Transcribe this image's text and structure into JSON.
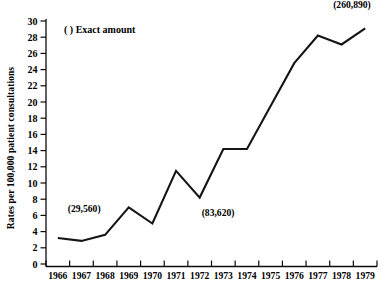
{
  "chart_data": {
    "type": "line",
    "title": "",
    "xlabel": "",
    "ylabel": "Rates per 100,000 patient consultations",
    "ylim": [
      0,
      30
    ],
    "ytick_step": 2,
    "grid": false,
    "legend_position": "top-left",
    "legend_entries": [
      "(  ) Exact amount"
    ],
    "categories": [
      "1966",
      "1967",
      "1968",
      "1969",
      "1970",
      "1971",
      "1972",
      "1973",
      "1974",
      "1975",
      "1976",
      "1977",
      "1978",
      "1979"
    ],
    "x": [
      1966,
      1967,
      1968,
      1969,
      1970,
      1971,
      1972,
      1973,
      1974,
      1975,
      1976,
      1977,
      1978,
      1979
    ],
    "values": [
      3.2,
      2.85,
      3.6,
      7.0,
      5.0,
      11.5,
      8.2,
      14.2,
      14.2,
      19.5,
      24.8,
      28.2,
      27.1,
      29.1
    ],
    "yticks": [
      "0",
      "2",
      "4",
      "6",
      "8",
      "10",
      "12",
      "14",
      "16",
      "18",
      "20",
      "22",
      "24",
      "26",
      "28",
      "30"
    ],
    "ytick_values": [
      0,
      2,
      4,
      6,
      8,
      10,
      12,
      14,
      16,
      18,
      20,
      22,
      24,
      26,
      28,
      30
    ],
    "annotations": [
      {
        "label": "(29,560)",
        "x": 1966,
        "y": 3.2,
        "dx": 10,
        "dy": -26
      },
      {
        "label": "(83,620)",
        "x": 1972,
        "y": 8.2,
        "dx": 2,
        "dy": 18
      },
      {
        "label": "(260,890)",
        "x": 1979,
        "y": 29.1,
        "dx": -32,
        "dy": -20
      }
    ]
  },
  "legend": {
    "marker": "(  )",
    "label": "(  ) Exact amount"
  },
  "axis": {
    "y_title": "Rates per 100,000 patient consultations"
  }
}
